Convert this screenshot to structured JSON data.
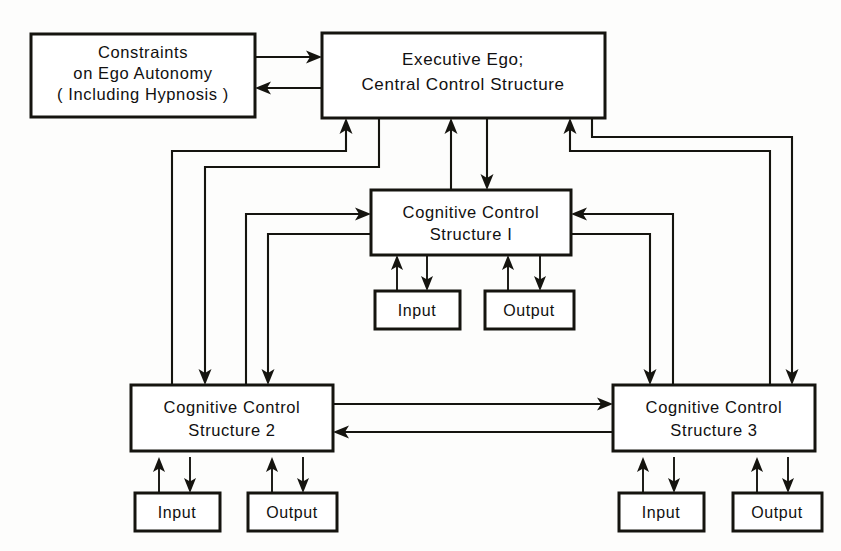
{
  "diagram": {
    "type": "block-diagram",
    "background_color": "#fdfdfc",
    "line_color": "#15140f",
    "box_fill": "#ffffff",
    "nodes": [
      {
        "id": "constraints",
        "name": "constraints-box",
        "lines": [
          "Constraints",
          "on Ego Autonomy",
          "( Including Hypnosis )"
        ],
        "x": 31,
        "y": 34,
        "w": 224,
        "h": 83
      },
      {
        "id": "executive_ego",
        "name": "executive-ego-box",
        "lines": [
          "Executive Ego;",
          "Central Control Structure"
        ],
        "x": 322,
        "y": 33,
        "w": 283,
        "h": 85
      },
      {
        "id": "ccs1",
        "name": "cognitive-control-structure-1-box",
        "lines": [
          "Cognitive Control",
          "Structure I"
        ],
        "x": 371,
        "y": 190,
        "w": 200,
        "h": 65
      },
      {
        "id": "ccs2",
        "name": "cognitive-control-structure-2-box",
        "lines": [
          "Cognitive Control",
          "Structure 2"
        ],
        "x": 131,
        "y": 385,
        "w": 202,
        "h": 66
      },
      {
        "id": "ccs3",
        "name": "cognitive-control-structure-3-box",
        "lines": [
          "Cognitive Control",
          "Structure 3"
        ],
        "x": 613,
        "y": 385,
        "w": 202,
        "h": 66
      },
      {
        "id": "input1",
        "name": "input-box-ccs1",
        "lines": [
          "Input"
        ],
        "x": 375,
        "y": 291,
        "w": 85,
        "h": 38
      },
      {
        "id": "output1",
        "name": "output-box-ccs1",
        "lines": [
          "Output"
        ],
        "x": 485,
        "y": 291,
        "w": 89,
        "h": 38
      },
      {
        "id": "input2",
        "name": "input-box-ccs2",
        "lines": [
          "Input"
        ],
        "x": 135,
        "y": 493,
        "w": 85,
        "h": 38
      },
      {
        "id": "output2",
        "name": "output-box-ccs2",
        "lines": [
          "Output"
        ],
        "x": 248,
        "y": 493,
        "w": 89,
        "h": 38
      },
      {
        "id": "input3",
        "name": "input-box-ccs3",
        "lines": [
          "Input"
        ],
        "x": 619,
        "y": 493,
        "w": 85,
        "h": 38
      },
      {
        "id": "output3",
        "name": "output-box-ccs3",
        "lines": [
          "Output"
        ],
        "x": 733,
        "y": 493,
        "w": 89,
        "h": 38
      }
    ],
    "edges": [
      {
        "from": "constraints",
        "to": "executive_ego",
        "direction": "to"
      },
      {
        "from": "executive_ego",
        "to": "constraints",
        "direction": "to"
      },
      {
        "from": "executive_ego",
        "to": "ccs1",
        "direction": "bidirectional"
      },
      {
        "from": "executive_ego",
        "to": "ccs2",
        "direction": "bidirectional"
      },
      {
        "from": "executive_ego",
        "to": "ccs3",
        "direction": "bidirectional"
      },
      {
        "from": "ccs1",
        "to": "ccs2",
        "direction": "bidirectional"
      },
      {
        "from": "ccs1",
        "to": "ccs3",
        "direction": "bidirectional"
      },
      {
        "from": "ccs2",
        "to": "ccs3",
        "direction": "bidirectional"
      },
      {
        "from": "ccs1",
        "to": "input1",
        "direction": "bidirectional"
      },
      {
        "from": "ccs1",
        "to": "output1",
        "direction": "bidirectional"
      },
      {
        "from": "ccs2",
        "to": "input2",
        "direction": "bidirectional"
      },
      {
        "from": "ccs2",
        "to": "output2",
        "direction": "bidirectional"
      },
      {
        "from": "ccs3",
        "to": "input3",
        "direction": "bidirectional"
      },
      {
        "from": "ccs3",
        "to": "output3",
        "direction": "bidirectional"
      }
    ]
  },
  "labels": {
    "constraints_l1": "Constraints",
    "constraints_l2": "on Ego Autonomy",
    "constraints_l3": "( Including Hypnosis )",
    "exec_l1": "Executive Ego;",
    "exec_l2": "Central Control Structure",
    "ccs1_l1": "Cognitive Control",
    "ccs1_l2": "Structure I",
    "ccs2_l1": "Cognitive Control",
    "ccs2_l2": "Structure 2",
    "ccs3_l1": "Cognitive Control",
    "ccs3_l2": "Structure 3",
    "input": "Input",
    "output": "Output"
  }
}
